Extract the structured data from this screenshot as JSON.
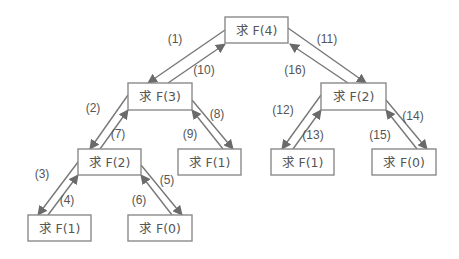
{
  "diagram": {
    "title": "",
    "colors": {
      "box_border": "#8a8a8a",
      "arrow": "#777777",
      "text": "#555555",
      "arrowhead": "#6a6a6a"
    },
    "nodes": [
      {
        "id": "f4",
        "label": "求 F(4)",
        "x": 225,
        "y": 17,
        "w": 63,
        "h": 26
      },
      {
        "id": "f3",
        "label": "求 F(3)",
        "x": 128,
        "y": 83,
        "w": 64,
        "h": 27
      },
      {
        "id": "f2a",
        "label": "求 F(2)",
        "x": 78,
        "y": 149,
        "w": 63,
        "h": 26
      },
      {
        "id": "f1a",
        "label": "求 F(1)",
        "x": 178,
        "y": 149,
        "w": 63,
        "h": 26
      },
      {
        "id": "f1b",
        "label": "求 F(1)",
        "x": 28,
        "y": 215,
        "w": 63,
        "h": 26
      },
      {
        "id": "f0a",
        "label": "求 F(0)",
        "x": 128,
        "y": 215,
        "w": 64,
        "h": 26
      },
      {
        "id": "f2b",
        "label": "求 F(2)",
        "x": 321,
        "y": 83,
        "w": 65,
        "h": 27
      },
      {
        "id": "f1c",
        "label": "求 F(1)",
        "x": 271,
        "y": 149,
        "w": 63,
        "h": 26
      },
      {
        "id": "f0b",
        "label": "求 F(0)",
        "x": 372,
        "y": 149,
        "w": 64,
        "h": 26
      }
    ],
    "edges": [
      {
        "step": "(1)",
        "x1": 225,
        "y1": 30,
        "x2": 148,
        "y2": 83,
        "lx": 175,
        "ly": 43
      },
      {
        "step": "(10)",
        "x1": 168,
        "y1": 83,
        "x2": 225,
        "y2": 44,
        "lx": 204,
        "ly": 74
      },
      {
        "step": "(11)",
        "x1": 288,
        "y1": 28,
        "x2": 366,
        "y2": 83,
        "lx": 327,
        "ly": 43
      },
      {
        "step": "(16)",
        "x1": 348,
        "y1": 83,
        "x2": 290,
        "y2": 44,
        "lx": 295,
        "ly": 74
      },
      {
        "step": "(2)",
        "x1": 128,
        "y1": 95,
        "x2": 90,
        "y2": 149,
        "lx": 93,
        "ly": 112
      },
      {
        "step": "(7)",
        "x1": 100,
        "y1": 149,
        "x2": 128,
        "y2": 110,
        "lx": 118,
        "ly": 138
      },
      {
        "step": "(8)",
        "x1": 192,
        "y1": 100,
        "x2": 233,
        "y2": 149,
        "lx": 217,
        "ly": 118
      },
      {
        "step": "(9)",
        "x1": 223,
        "y1": 149,
        "x2": 192,
        "y2": 110,
        "lx": 190,
        "ly": 138
      },
      {
        "step": "(3)",
        "x1": 78,
        "y1": 162,
        "x2": 38,
        "y2": 215,
        "lx": 42,
        "ly": 178
      },
      {
        "step": "(4)",
        "x1": 48,
        "y1": 215,
        "x2": 78,
        "y2": 175,
        "lx": 67,
        "ly": 204
      },
      {
        "step": "(5)",
        "x1": 141,
        "y1": 165,
        "x2": 182,
        "y2": 215,
        "lx": 167,
        "ly": 184
      },
      {
        "step": "(6)",
        "x1": 172,
        "y1": 215,
        "x2": 141,
        "y2": 175,
        "lx": 139,
        "ly": 204
      },
      {
        "step": "(12)",
        "x1": 321,
        "y1": 95,
        "x2": 282,
        "y2": 149,
        "lx": 283,
        "ly": 114
      },
      {
        "step": "(13)",
        "x1": 293,
        "y1": 149,
        "x2": 321,
        "y2": 110,
        "lx": 313,
        "ly": 139
      },
      {
        "step": "(14)",
        "x1": 386,
        "y1": 100,
        "x2": 427,
        "y2": 149,
        "lx": 413,
        "ly": 120
      },
      {
        "step": "(15)",
        "x1": 417,
        "y1": 149,
        "x2": 386,
        "y2": 110,
        "lx": 380,
        "ly": 139
      }
    ]
  }
}
